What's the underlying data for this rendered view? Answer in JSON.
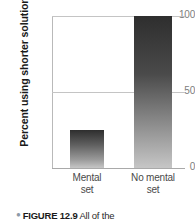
{
  "chart_data": {
    "type": "bar",
    "title": "",
    "xlabel": "",
    "ylabel": "Percent using shorter solution",
    "categories": [
      "Mental set",
      "No mental set"
    ],
    "category_lines": [
      [
        "Mental",
        "set"
      ],
      [
        "No mental",
        "set"
      ]
    ],
    "values": [
      25,
      100
    ],
    "ylim": [
      0,
      100
    ],
    "yticks": [
      0,
      50,
      100
    ],
    "ytick_labels": [
      "0",
      "50",
      "100"
    ],
    "grid": true,
    "gridlines_at": [
      50,
      100
    ],
    "legend": "none",
    "bar_colors": [
      "#5e5e5e",
      "#4a4a4a"
    ],
    "bar_gradient": "dark-top-to-light-bottom",
    "grid_color": "#c4c4c4",
    "axis_color": "#a9a9a9",
    "tick_label_color": "#7d7d7d"
  },
  "axis": {
    "y_title": "Percent using shorter solution",
    "tick_100": "100",
    "tick_50": "50",
    "tick_0": "0"
  },
  "bars": [
    {
      "label_line1": "Mental",
      "label_line2": "set",
      "value": 25
    },
    {
      "label_line1": "No mental",
      "label_line2": "set",
      "value": 100
    }
  ],
  "caption": {
    "bullet": "●",
    "label": "FIGURE 12.9",
    "text": "All of the"
  }
}
